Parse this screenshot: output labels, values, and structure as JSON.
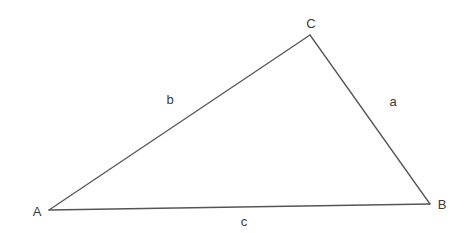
{
  "diagram": {
    "type": "triangle",
    "vertices": [
      {
        "id": "A",
        "label": "A",
        "x": 49,
        "y": 210,
        "label_x": 37,
        "label_y": 211
      },
      {
        "id": "B",
        "label": "B",
        "x": 430,
        "y": 204,
        "label_x": 442,
        "label_y": 204
      },
      {
        "id": "C",
        "label": "C",
        "x": 310,
        "y": 35,
        "label_x": 311,
        "label_y": 23
      }
    ],
    "sides": [
      {
        "id": "a",
        "label": "a",
        "from": "B",
        "to": "C",
        "label_x": 393,
        "label_y": 101
      },
      {
        "id": "b",
        "label": "b",
        "from": "A",
        "to": "C",
        "label_x": 170,
        "label_y": 99
      },
      {
        "id": "c",
        "label": "c",
        "from": "A",
        "to": "B",
        "label_x": 244,
        "label_y": 221
      }
    ],
    "stroke_color": "#555555",
    "text_color": "#3a3a3a"
  }
}
